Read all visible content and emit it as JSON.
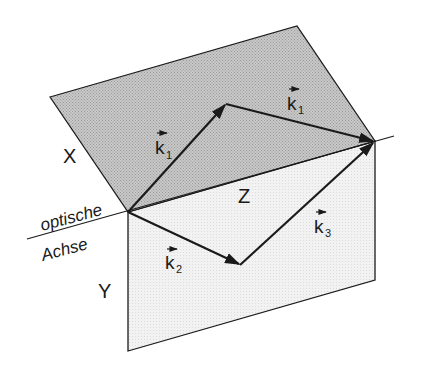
{
  "diagram": {
    "colors": {
      "plane_x_fill": "#bdbdbd",
      "plane_y_fill": "#ededed",
      "stroke": "#1a1a1a",
      "background": "#ffffff"
    },
    "labels": {
      "plane_x": "X",
      "plane_y": "Y",
      "plane_z": "Z",
      "axis_line1": "optische",
      "axis_line2": "Achse",
      "k1_a_letter": "k",
      "k1_a_sub": "1",
      "k1_b_letter": "k",
      "k1_b_sub": "1",
      "k2_letter": "k",
      "k2_sub": "2",
      "k3_letter": "k",
      "k3_sub": "3"
    },
    "points": {
      "origin": [
        128,
        212
      ],
      "x_top_left": [
        50,
        97
      ],
      "x_top_right": [
        297,
        26
      ],
      "right_vertex": [
        375,
        141
      ],
      "y_bottom_left": [
        128,
        351
      ],
      "y_bottom_right": [
        375,
        280
      ],
      "k1_apex": [
        226,
        104
      ],
      "k2_end": [
        240,
        265
      ],
      "axis_left": [
        27,
        239
      ],
      "axis_right": [
        394,
        136
      ]
    },
    "vectors": [
      {
        "name": "k1",
        "from": "origin",
        "to": "k1_apex"
      },
      {
        "name": "k1",
        "from": "k1_apex",
        "to": "right_vertex"
      },
      {
        "name": "k2",
        "from": "origin",
        "to": "k2_end"
      },
      {
        "name": "k3",
        "from": "k2_end",
        "to": "right_vertex"
      }
    ]
  }
}
